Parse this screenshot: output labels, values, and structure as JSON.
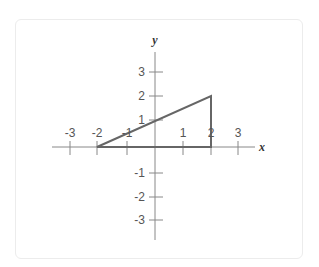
{
  "diagram": {
    "type": "coordinate-plane",
    "axes": {
      "x_label": "x",
      "y_label": "y",
      "x_ticks": [
        {
          "value": -3,
          "label": "-3"
        },
        {
          "value": -2,
          "label": "-2"
        },
        {
          "value": -1,
          "label": "-1"
        },
        {
          "value": 1,
          "label": "1"
        },
        {
          "value": 2,
          "label": "2"
        },
        {
          "value": 3,
          "label": "3"
        }
      ],
      "y_ticks": [
        {
          "value": 3,
          "label": "3"
        },
        {
          "value": 2,
          "label": "2"
        },
        {
          "value": 1,
          "label": "1"
        },
        {
          "value": -1,
          "label": "-1"
        },
        {
          "value": -2,
          "label": "-2"
        },
        {
          "value": -3,
          "label": "-3"
        }
      ]
    },
    "shape": {
      "type": "triangle",
      "vertices": [
        [
          -2,
          0
        ],
        [
          2,
          0
        ],
        [
          2,
          2
        ]
      ],
      "stroke_color": "#666666"
    },
    "colors": {
      "axis": "#888888",
      "tick_label": "#555555",
      "axis_label": "#333333"
    }
  }
}
